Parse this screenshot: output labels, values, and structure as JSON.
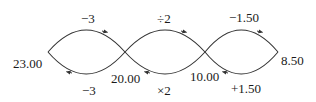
{
  "diagram": {
    "type": "inverse-operations flow",
    "nodes": [
      {
        "id": "n0",
        "label": "23.00"
      },
      {
        "id": "n1",
        "label": "20.00"
      },
      {
        "id": "n2",
        "label": "10.00"
      },
      {
        "id": "n3",
        "label": "8.50"
      }
    ],
    "loops": [
      {
        "forward_label": "−3",
        "backward_label": "−3"
      },
      {
        "forward_label": "÷2",
        "backward_label": "×2"
      },
      {
        "forward_label": "−1.50",
        "backward_label": "+1.50"
      }
    ],
    "stroke_color": "#333333",
    "text_color": "#1a1a1a"
  }
}
